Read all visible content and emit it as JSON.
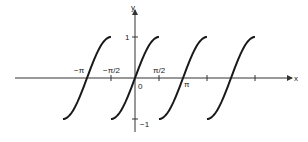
{
  "chart_data": {
    "type": "line",
    "title": "",
    "function": "y = sin(x - kπ) on [kπ - π/2, kπ + π/2], repeated every π",
    "xlabel": "x",
    "ylabel": "y",
    "origin_label": "0",
    "x_tick_labels": [
      "−π",
      "−π/2",
      "π/2",
      "π"
    ],
    "y_tick_labels": [
      "1",
      "−1"
    ],
    "xlim": [
      -4.3,
      7.2
    ],
    "ylim": [
      -1.3,
      1.8
    ],
    "grid": false,
    "legend": null,
    "series": [
      {
        "name": "branch centered at −π",
        "x_range": [
          -4.712,
          -1.571
        ],
        "y_range": [
          -1,
          1
        ]
      },
      {
        "name": "branch centered at 0",
        "x_range": [
          -1.571,
          1.571
        ],
        "y_range": [
          -1,
          1
        ]
      },
      {
        "name": "branch centered at π",
        "x_range": [
          1.571,
          4.712
        ],
        "y_range": [
          -1,
          1
        ]
      },
      {
        "name": "branch centered at 2π",
        "x_range": [
          4.712,
          7.854
        ],
        "y_range": [
          -1,
          1
        ]
      }
    ],
    "centers": [
      -3.1416,
      0,
      3.1416,
      6.2832
    ]
  },
  "colors": {
    "curve": "#1a1a1a",
    "axis": "#333333"
  }
}
